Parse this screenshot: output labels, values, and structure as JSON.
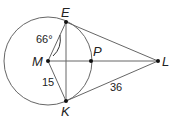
{
  "points": {
    "E": {
      "label": "E",
      "x": 66,
      "y": 22
    },
    "M": {
      "label": "M",
      "x": 48,
      "y": 61
    },
    "K": {
      "label": "K",
      "x": 66,
      "y": 101
    },
    "P": {
      "label": "P",
      "x": 91,
      "y": 61
    },
    "L": {
      "label": "L",
      "x": 158,
      "y": 61
    }
  },
  "circle": {
    "center": "M",
    "radius": 44
  },
  "measures": {
    "angle_EMP": "66°",
    "MK": "15",
    "KL": "36"
  },
  "colors": {
    "stroke": "#555555",
    "text": "#222222",
    "point": "#111111"
  }
}
